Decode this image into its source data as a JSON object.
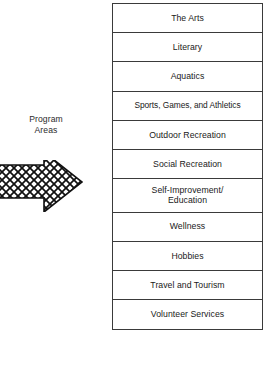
{
  "diagram": {
    "title": "Program Areas",
    "label": {
      "lines": [
        "Program",
        "Areas"
      ]
    },
    "arrow": {
      "icon": "right-arrow-crosshatch",
      "direction": "right",
      "fill_pattern": "crosshatch"
    },
    "program_areas": [
      {
        "label": "The Arts",
        "lines": 1
      },
      {
        "label": "Literary",
        "lines": 1
      },
      {
        "label": "Aquatics",
        "lines": 1
      },
      {
        "label": "Sports, Games, and Athletics",
        "lines": 1
      },
      {
        "label": "Outdoor Recreation",
        "lines": 1
      },
      {
        "label": "Social Recreation",
        "lines": 1
      },
      {
        "label": "Self-Improvement/\nEducation",
        "lines": 2
      },
      {
        "label": "Wellness",
        "lines": 1
      },
      {
        "label": "Hobbies",
        "lines": 1
      },
      {
        "label": "Travel and Tourism",
        "lines": 1
      },
      {
        "label": "Volunteer Services",
        "lines": 1
      }
    ],
    "colors": {
      "border": "#3a3a3a",
      "text": "#1a1a1a",
      "background": "#ffffff",
      "arrow_outline": "#111111"
    }
  }
}
